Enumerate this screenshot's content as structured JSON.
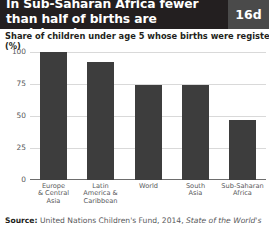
{
  "header": {
    "title_line1": "In Sub-Saharan Africa fewer",
    "title_line2": "than half of births are registered",
    "badge": "16d",
    "bg_color": "#231f20",
    "badge_color": "#4a4a4a"
  },
  "subtitle": {
    "text": "Share of children under age 5 whose births were registered, 2011",
    "unit": "(%)"
  },
  "source": {
    "label": "Source:",
    "text": "United Nations Children's Fund, 2014,",
    "italic": "State of the World's"
  },
  "chart_data": {
    "type": "bar",
    "title": "Share of children under age 5 whose births were registered, 2011",
    "xlabel": "",
    "ylabel": "(%)",
    "ylim": [
      0,
      100
    ],
    "yticks": [
      0,
      25,
      50,
      75,
      100
    ],
    "ytick_labels": [
      "0",
      "25",
      "50",
      "75",
      "100"
    ],
    "grid": true,
    "legend": "none",
    "bar_color": "#3d3d3d",
    "categories": [
      "Europe\n& Central\nAsia",
      "Latin\nAmerica &\nCaribbean",
      "World",
      "South\nAsia",
      "Sub-Saharan\nAfrica"
    ],
    "category_lines": [
      [
        "Europe",
        "& Central",
        "Asia"
      ],
      [
        "Latin",
        "America &",
        "Caribbean"
      ],
      [
        "World"
      ],
      [
        "South",
        "Asia"
      ],
      [
        "Sub-Saharan",
        "Africa"
      ]
    ],
    "values": [
      100,
      92,
      74,
      74,
      47
    ]
  }
}
